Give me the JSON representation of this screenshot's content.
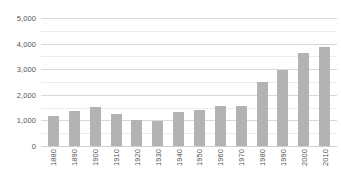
{
  "chart_data": {
    "type": "bar",
    "title": "",
    "subtitle": "",
    "xlabel": "",
    "ylabel": "",
    "grid": true,
    "legend": null,
    "ylim": [
      0,
      5000
    ],
    "ytick_labels": [
      "5,000",
      "4,000",
      "3,000",
      "2,000",
      "1,000",
      "0"
    ],
    "ytick_values": [
      5000,
      4000,
      3000,
      2000,
      1000,
      0
    ],
    "minor_ytick_values": [
      4500,
      3500,
      2500,
      1500,
      500
    ],
    "categories": [
      "1880",
      "1890",
      "1900",
      "1910",
      "1920",
      "1930",
      "1940",
      "1950",
      "1960",
      "1970",
      "1980",
      "1990",
      "2000",
      "2010"
    ],
    "values": [
      1170,
      1370,
      1520,
      1250,
      1020,
      980,
      1330,
      1410,
      1560,
      1560,
      2500,
      2970,
      3630,
      3870
    ],
    "bar_color": "#b3b3b3",
    "gridline_color": "#d8d8d8",
    "minor_gridline_color": "#ececec",
    "background_color": "#ffffff",
    "tick_label_color": "#555555"
  }
}
